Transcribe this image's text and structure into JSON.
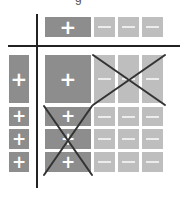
{
  "clipped_header_text": "g",
  "colors": {
    "positive_block": "#8d8d8d",
    "negative_block": "#bebebe",
    "axis_line": "#222222",
    "cross_line": "#333333",
    "symbol": "#ffffff"
  },
  "symbols": {
    "plus": "+",
    "minus": "−"
  },
  "top_row": {
    "cells": [
      {
        "sign": "plus",
        "label": "+"
      },
      {
        "sign": "minus",
        "label": "−"
      },
      {
        "sign": "minus",
        "label": "−"
      },
      {
        "sign": "minus",
        "label": "−"
      }
    ]
  },
  "left_column": {
    "cells": [
      {
        "sign": "plus",
        "label": "+"
      },
      {
        "sign": "plus",
        "label": "+"
      },
      {
        "sign": "plus",
        "label": "+"
      },
      {
        "sign": "plus",
        "label": "+"
      }
    ]
  },
  "grid": {
    "rows": [
      [
        "+",
        "−",
        "−",
        "−"
      ],
      [
        "+",
        "−",
        "−",
        "−"
      ],
      [
        "+",
        "−",
        "−",
        "−"
      ],
      [
        "+",
        "−",
        "−",
        "−"
      ]
    ],
    "crossed_regions": [
      {
        "name": "upper-right",
        "rows": [
          0
        ],
        "cols": [
          1,
          2,
          3
        ]
      },
      {
        "name": "lower-left",
        "rows": [
          1,
          2,
          3
        ],
        "cols": [
          0
        ]
      }
    ]
  }
}
